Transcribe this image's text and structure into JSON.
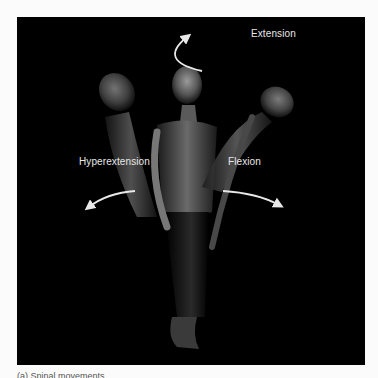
{
  "figure": {
    "background_color": "#000000",
    "page_color": "#fbfbfb",
    "label_color": "#e8e8e8",
    "labels": {
      "extension": "Extension",
      "hyperextension": "Hyperextension",
      "flexion": "Flexion"
    },
    "arrows": [
      {
        "name": "extension-arrow",
        "direction": "up-left"
      },
      {
        "name": "hyperextension-arrow",
        "direction": "down-left"
      },
      {
        "name": "flexion-arrow",
        "direction": "down-right"
      }
    ],
    "poses": [
      "hyperextension",
      "neutral",
      "flexion"
    ]
  },
  "caption": {
    "text": "(a) Spinal movements"
  }
}
